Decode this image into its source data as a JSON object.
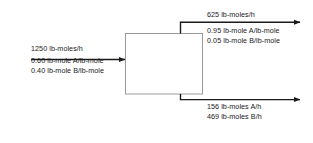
{
  "diagram": {
    "unit": {
      "name": "process-unit",
      "label": "",
      "border_color": "#999999",
      "fill_color": "#ffffff"
    },
    "line_color": "#1a1a1a",
    "text_color": "#1a1a1a",
    "streams": {
      "feed": {
        "name": "feed-stream",
        "direction": "right",
        "rate": "1250 lb-moles/h",
        "composition": [
          "0.60 lb-mole A/lb-mole",
          "0.40 lb-mole B/lb-mole"
        ]
      },
      "top_product": {
        "name": "top-product-stream",
        "direction": "right",
        "rate": "625 lb-moles/h",
        "composition": [
          "0.95 lb-mole A/lb-mole",
          "0.05 lb-mole B/lb-mole"
        ]
      },
      "bottom_product": {
        "name": "bottom-product-stream",
        "direction": "right",
        "rate": "",
        "composition": [
          "156 lb-moles A/h",
          "469 lb-moles B/h"
        ]
      }
    }
  }
}
